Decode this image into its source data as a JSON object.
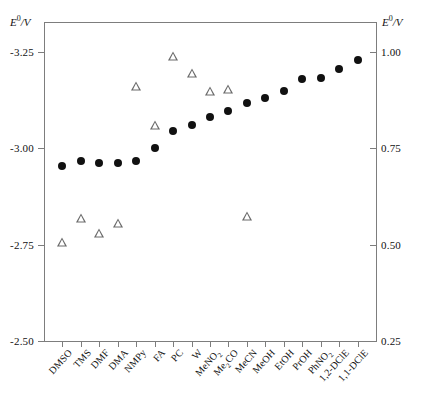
{
  "chart_data": {
    "type": "scatter",
    "title": "",
    "ylabel_left": "E°/V",
    "ylabel_right": "E°/V",
    "xlabel": "",
    "categories": [
      "DMSO",
      "TMS",
      "DMF",
      "DMA",
      "NMPy",
      "FA",
      "PC",
      "W",
      "MeNO2",
      "Me2CO",
      "MeCN",
      "MeOH",
      "EtOH",
      "PrOH",
      "PhNO2",
      "1,2-DClE",
      "1,1-DClE"
    ],
    "category_labels": [
      {
        "text": "DMSO"
      },
      {
        "text": "TMS"
      },
      {
        "text": "DMF"
      },
      {
        "text": "DMA"
      },
      {
        "text": "NMPy"
      },
      {
        "text": "FA"
      },
      {
        "text": "PC"
      },
      {
        "text": "W"
      },
      {
        "text": "MeNO",
        "sub": "2"
      },
      {
        "text": "Me",
        "sub": "2",
        "text2": "CO"
      },
      {
        "text": "MeCN"
      },
      {
        "text": "MeOH"
      },
      {
        "text": "EtOH"
      },
      {
        "text": "PrOH"
      },
      {
        "text": "PhNO",
        "sub": "2"
      },
      {
        "text": "1,2-DClE"
      },
      {
        "text": "1,1-DClE"
      }
    ],
    "yticks_left": [
      "-3.25",
      "-3.00",
      "-2.75",
      "-2.50"
    ],
    "ytick_values_left": [
      -3.25,
      -3.0,
      -2.75,
      -2.5
    ],
    "yticks_right": [
      "1.00",
      "0.75",
      "0.50",
      "0.25"
    ],
    "ytick_values_right": [
      1.0,
      0.75,
      0.5,
      0.25
    ],
    "ylim_left": [
      -2.5,
      -3.32
    ],
    "ylim_right": [
      0.25,
      1.07
    ],
    "grid": false,
    "legend": "none",
    "series": [
      {
        "name": "filled-circle-series",
        "marker": "filled-circle",
        "axis": "left",
        "values": [
          -2.955,
          -2.968,
          -2.963,
          -2.962,
          -2.968,
          -3.0,
          -3.045,
          -3.06,
          -3.082,
          -3.097,
          -3.118,
          -3.13,
          -3.148,
          -3.18,
          -3.182,
          -3.205,
          -3.228
        ]
      },
      {
        "name": "open-triangle-series",
        "marker": "open-triangle",
        "axis": "left",
        "values": [
          -2.757,
          -2.818,
          -2.78,
          -2.805,
          -3.162,
          -3.06,
          -3.24,
          -3.195,
          -3.148,
          -3.155,
          -2.825,
          null,
          null,
          null,
          null,
          null,
          null
        ]
      }
    ]
  },
  "axis_titles": {
    "left": "E",
    "left_sup": "0",
    "left_unit": "/V",
    "right": "E",
    "right_sup": "0",
    "right_unit": "/V"
  }
}
